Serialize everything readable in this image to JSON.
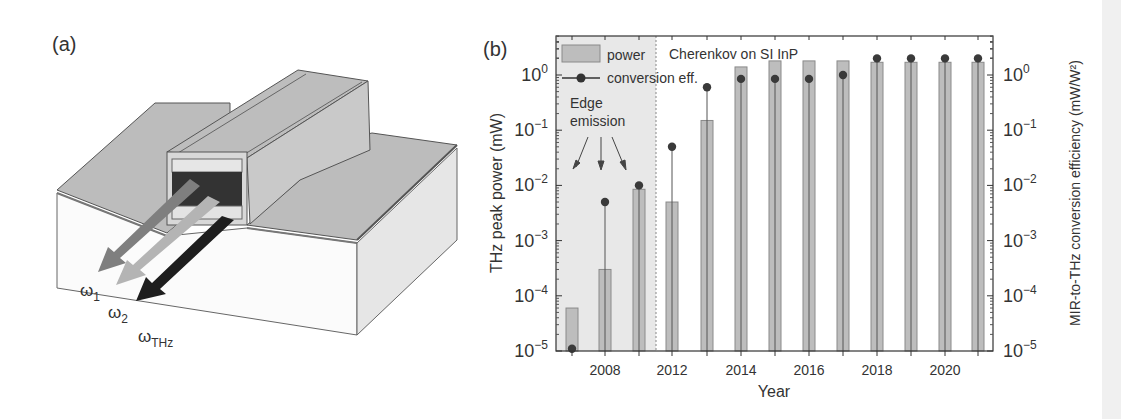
{
  "panel_a": {
    "label": "(a)",
    "beam_labels": {
      "omega1": "ω",
      "omega1_sub": "1",
      "omega2": "ω",
      "omega2_sub": "2",
      "omegaTHz": "ω",
      "omegaTHz_sub": "THz"
    },
    "colors": {
      "top_surface": "#b9b9b9",
      "front_face": "#fbfbfb",
      "side_face": "#e6e6e6",
      "beam_omega1": "#7f7f7f",
      "beam_omega2": "#b4b4b4",
      "beam_thz": "#1e1e1e"
    }
  },
  "panel_b": {
    "label": "(b)",
    "legend": {
      "power": "power",
      "conversion": "conversion eff."
    },
    "annotations": {
      "cherenkov": "Cherenkov on SI InP",
      "edge_line1": "Edge",
      "edge_line2": "emission"
    },
    "colors": {
      "bar_fill": "#bdbdbd",
      "bar_stroke": "#8a8a8a",
      "dot": "#3a3a3a",
      "shaded_region": "#e8e8e8"
    }
  },
  "chart_data": {
    "type": "bar",
    "title": "",
    "xlabel": "Year",
    "ylabel": "THz peak power (mW)",
    "ylabel_right": "MIR-to-THz conversion efficiency (mW/W²)",
    "yscale": "log",
    "ylim": [
      1e-05,
      5
    ],
    "y_ticks": [
      "10⁰",
      "10⁻¹",
      "10⁻²",
      "10⁻³",
      "10⁻⁴",
      "10⁻⁵"
    ],
    "y_ticks_right": [
      "10⁰",
      "10⁻¹",
      "10⁻²",
      "10⁻³",
      "10⁻⁴",
      "10⁻⁵"
    ],
    "x_tick_labels": [
      "2008",
      "2012",
      "2014",
      "2016",
      "2018",
      "2020"
    ],
    "categories": [
      "2007",
      "2008",
      "2010",
      "2012",
      "2013",
      "2014",
      "2015",
      "2016",
      "2017",
      "2018",
      "2019",
      "2020",
      "2021"
    ],
    "series": [
      {
        "name": "power",
        "kind": "bar",
        "values": [
          6e-05,
          0.0003,
          0.0085,
          0.005,
          0.15,
          1.4,
          1.8,
          1.8,
          1.8,
          1.7,
          1.7,
          1.7,
          1.7
        ]
      },
      {
        "name": "conversion eff.",
        "kind": "lollipop",
        "values": [
          1.1e-05,
          0.005,
          0.01,
          0.05,
          0.6,
          0.85,
          0.85,
          0.85,
          1.0,
          2.0,
          2.0,
          2.0,
          2.0
        ]
      }
    ],
    "regions": [
      {
        "label": "Edge emission",
        "from_index": 0,
        "to_index": 2,
        "shaded": true
      },
      {
        "label": "Cherenkov on SI InP",
        "from_index": 3,
        "to_index": 12,
        "shaded": false
      }
    ],
    "legend_position": "upper left"
  }
}
